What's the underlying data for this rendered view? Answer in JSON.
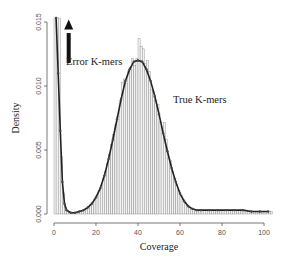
{
  "chart_data": {
    "type": "bar",
    "title": "",
    "xlabel": "Coverage",
    "ylabel": "Density",
    "xlim": [
      0,
      104
    ],
    "ylim": [
      0,
      0.0155
    ],
    "x_ticks": [
      0,
      20,
      40,
      60,
      80,
      100
    ],
    "y_ticks": [
      "0.000",
      "0.005",
      "0.010",
      "0.015"
    ],
    "grid": false,
    "legend": null,
    "annotations": [
      {
        "text": "Error K-mers",
        "x": 4,
        "y": 0.0118,
        "arrow": "up",
        "arrow_x": 7,
        "arrow_from": 0.0132,
        "arrow_to": 0.0152
      },
      {
        "text": "True K-mers",
        "x": 63,
        "y": 0.0092
      }
    ],
    "series": [
      {
        "name": "histogram",
        "kind": "bar",
        "bin_width": 1,
        "note": "error spike at coverage 1-3 exceeds 0.015 (clipped)"
      },
      {
        "name": "fitted density",
        "kind": "line-with-markers",
        "x": [
          1,
          2,
          3,
          4,
          5,
          6,
          8,
          10,
          12,
          14,
          16,
          18,
          20,
          22,
          24,
          26,
          28,
          30,
          32,
          34,
          36,
          38,
          40,
          42,
          44,
          46,
          48,
          50,
          52,
          54,
          56,
          58,
          60,
          62,
          64,
          66,
          68,
          70,
          74,
          78,
          82,
          86,
          90,
          94,
          98,
          102
        ],
        "y": [
          0.0155,
          0.011,
          0.0065,
          0.0025,
          0.0008,
          0.0003,
          0.0001,
          0.0001,
          0.0002,
          0.0003,
          0.0005,
          0.0008,
          0.0013,
          0.002,
          0.003,
          0.0043,
          0.0058,
          0.0074,
          0.009,
          0.0104,
          0.0113,
          0.0119,
          0.012,
          0.0119,
          0.0113,
          0.0104,
          0.0092,
          0.0078,
          0.0063,
          0.0049,
          0.0036,
          0.0025,
          0.0016,
          0.001,
          0.0006,
          0.0004,
          0.0003,
          0.0003,
          0.0003,
          0.0003,
          0.0003,
          0.0003,
          0.0003,
          0.0002,
          0.0002,
          0.0002
        ]
      }
    ]
  }
}
